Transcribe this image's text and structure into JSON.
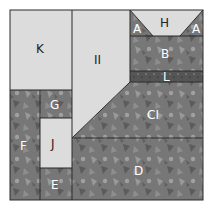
{
  "colors": {
    "light": "#dcdcdc",
    "print": "#7a7a7a",
    "dark_print": "#5e5e5e",
    "line": "#2a2a2a",
    "label_dark": "#222222",
    "label_light": "#ffffff"
  },
  "pieces": [
    {
      "id": "K",
      "label": "K"
    },
    {
      "id": "II",
      "label": "II"
    },
    {
      "id": "H",
      "label": "H"
    },
    {
      "id": "A-left",
      "label": "A"
    },
    {
      "id": "A-right",
      "label": "A"
    },
    {
      "id": "B",
      "label": "B"
    },
    {
      "id": "L",
      "label": "L"
    },
    {
      "id": "CI",
      "label": "CI"
    },
    {
      "id": "G",
      "label": "G"
    },
    {
      "id": "F",
      "label": "F"
    },
    {
      "id": "J",
      "label": "J"
    },
    {
      "id": "E",
      "label": "E"
    },
    {
      "id": "D",
      "label": "D"
    }
  ]
}
